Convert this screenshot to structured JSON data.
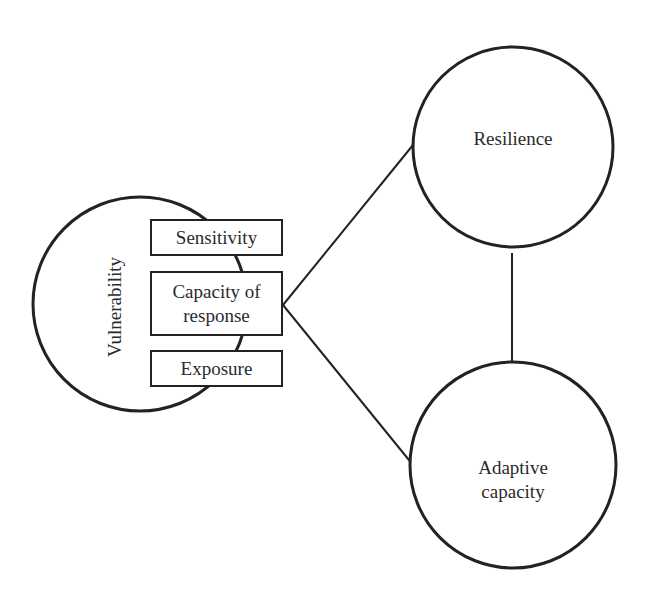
{
  "diagram": {
    "nodes": {
      "vulnerability": {
        "label": "Vulnerability",
        "shape": "circle",
        "orientation": "vertical"
      },
      "resilience": {
        "label": "Resilience",
        "shape": "circle"
      },
      "adaptive_capacity": {
        "label_line1": "Adaptive",
        "label_line2": "capacity",
        "shape": "circle"
      }
    },
    "components": [
      {
        "id": "sensitivity",
        "label": "Sensitivity"
      },
      {
        "id": "capacity_of_response",
        "label_line1": "Capacity of",
        "label_line2": "response"
      },
      {
        "id": "exposure",
        "label": "Exposure"
      }
    ],
    "edges": [
      {
        "from": "capacity_of_response",
        "to": "resilience"
      },
      {
        "from": "capacity_of_response",
        "to": "adaptive_capacity"
      },
      {
        "from": "resilience",
        "to": "adaptive_capacity"
      }
    ],
    "colors": {
      "stroke": "#222222",
      "background": "#ffffff",
      "text": "#2b2b2b"
    }
  }
}
